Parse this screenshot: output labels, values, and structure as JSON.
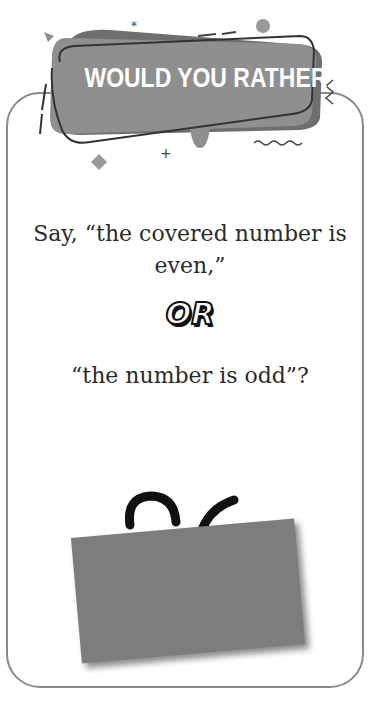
{
  "banner": {
    "title": "WOULD YOU RATHER"
  },
  "question": {
    "option_a": "Say, “the covered number is even,”",
    "separator": "OR",
    "option_b": "“the number is odd”?"
  },
  "covered_number": {
    "visible_digits": "26"
  },
  "colors": {
    "banner_fill": "#8f8f8f",
    "banner_shadow": "#6f6f6f",
    "frame_border": "#8a8a8a",
    "cover_card": "#7d7d7d",
    "text": "#2b2b2b"
  }
}
